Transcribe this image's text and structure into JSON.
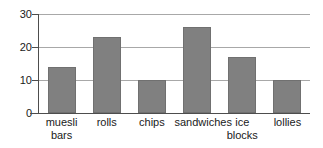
{
  "chart_data": {
    "type": "bar",
    "title": "",
    "xlabel": "",
    "ylabel": "",
    "categories": [
      "muesli bars",
      "rolls",
      "chips",
      "sandwiches",
      "ice blocks",
      "lollies"
    ],
    "category_lines": [
      [
        "muesli",
        "bars"
      ],
      [
        "rolls"
      ],
      [
        "chips"
      ],
      [
        "sandwiches"
      ],
      [
        "ice",
        "blocks"
      ],
      [
        "lollies"
      ]
    ],
    "values": [
      14,
      23,
      10,
      26,
      17,
      10
    ],
    "ylim": [
      0,
      30
    ],
    "yticks": [
      0,
      10,
      20,
      30
    ],
    "ytick_labels": [
      "0",
      "10",
      "20",
      "30"
    ],
    "grid": true,
    "grid_axis": "y",
    "legend": false,
    "bar_color": "#808080",
    "bar_edge_color": "#707070",
    "grid_color": "#a8a8a8",
    "axis_color": "#4d4d4d",
    "text_color": "#1a1a1a",
    "background_color": "#ffffff"
  }
}
